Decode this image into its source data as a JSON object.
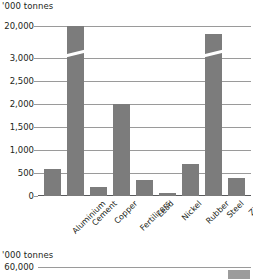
{
  "chart_data": [
    {
      "type": "bar",
      "title": "",
      "unit_label": "'000 tonnes",
      "ylabel": "",
      "xlabel": "",
      "categories": [
        "Aluminium",
        "Cement",
        "Copper",
        "Fertilizers",
        "Lead",
        "Nickel",
        "Rubber",
        "Steel",
        "Zinc"
      ],
      "values": [
        600,
        20000,
        200,
        2750,
        350,
        30,
        700,
        19500,
        400
      ],
      "ytick_labels": [
        "0",
        "500",
        "1,000",
        "1,500",
        "2,000",
        "2,500",
        "3,000",
        "20,000"
      ],
      "ytick_values": [
        0,
        500,
        1000,
        1500,
        2000,
        2500,
        3000,
        20000
      ],
      "ylim": [
        0,
        20000
      ],
      "axis_break": true,
      "axis_break_note": "Y axis broken between 3,000 and 20,000",
      "grid": true,
      "legend": "none",
      "bar_color": "#7c7c7c",
      "grid_color": "#9a9a9a"
    },
    {
      "type": "bar",
      "title": "",
      "unit_label": "'000 tonnes",
      "ylabel": "",
      "xlabel": "",
      "categories": [
        ""
      ],
      "values": [
        58000
      ],
      "ytick_labels": [
        "60,000"
      ],
      "ytick_values": [
        60000
      ],
      "grid": true,
      "legend": "none",
      "bar_color": "#9c9c9c",
      "grid_color": "#9a9a9a",
      "note": "second chart cropped at bottom edge of screenshot"
    }
  ],
  "chart1": {
    "unit_label": "'000 tonnes",
    "yticks": [
      {
        "label": "0",
        "top": 196
      },
      {
        "label": "500",
        "top": 173
      },
      {
        "label": "1,000",
        "top": 150
      },
      {
        "label": "1,500",
        "top": 127
      },
      {
        "label": "2,000",
        "top": 104
      },
      {
        "label": "2,500",
        "top": 81
      },
      {
        "label": "3,000",
        "top": 58
      },
      {
        "label": "20,000",
        "top": 26
      }
    ],
    "bars": [
      {
        "label": "Aluminium",
        "value": 600,
        "left": 6,
        "width": 17,
        "height": 27
      },
      {
        "label": "Cement",
        "value": 20000,
        "left": 29,
        "width": 17,
        "height": 170
      },
      {
        "label": "Copper",
        "value": 200,
        "left": 52,
        "width": 17,
        "height": 9
      },
      {
        "label": "Fertilizers",
        "value": 2750,
        "left": 75,
        "width": 17,
        "height": 92
      },
      {
        "label": "Lead",
        "value": 350,
        "left": 98,
        "width": 17,
        "height": 16
      },
      {
        "label": "Nickel",
        "value": 30,
        "left": 121,
        "width": 17,
        "height": 3
      },
      {
        "label": "Rubber",
        "value": 700,
        "left": 144,
        "width": 17,
        "height": 32
      },
      {
        "label": "Steel",
        "value": 19500,
        "left": 167,
        "width": 17,
        "height": 162
      },
      {
        "label": "Zinc",
        "value": 400,
        "left": 190,
        "width": 17,
        "height": 18
      }
    ]
  },
  "chart2": {
    "unit_label": "'000 tonnes",
    "ytick_label": "60,000",
    "bar": {
      "left": 190,
      "width": 22,
      "height": 9
    }
  }
}
